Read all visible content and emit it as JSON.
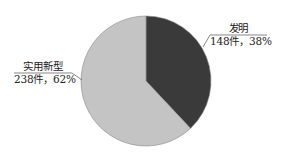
{
  "chart_data": {
    "type": "pie",
    "title": "",
    "slices": [
      {
        "label": "发明",
        "count": 148,
        "count_text": "148件，38%",
        "percent": 38,
        "color": "#3a3a3a"
      },
      {
        "label": "实用新型",
        "count": 238,
        "count_text": "238件，62%",
        "percent": 62,
        "color": "#c4c4c4"
      }
    ],
    "start_angle_deg": 0,
    "direction": "clockwise",
    "legend": "none (leader-line labels)",
    "outline_color": "#8a8a8a"
  },
  "labels": {
    "invention_name": "发明",
    "invention_value": "148件，38%",
    "utility_name": "实用新型",
    "utility_value": "238件，62%"
  }
}
